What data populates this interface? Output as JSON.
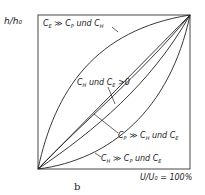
{
  "figure": {
    "panel_label": "b",
    "y_axis_label": "h/h₀",
    "x_axis_label": "U/U₀ = 100%",
    "colors": {
      "line": "#222222",
      "background": "#ffffff"
    }
  },
  "curves": [
    {
      "id": "upper",
      "label": "C'E >> C'P und C'H",
      "shape": "concave-up-left"
    },
    {
      "id": "middle",
      "label": "C'H und C'E > 0",
      "shape": "near-linear"
    },
    {
      "id": "near-diagonal",
      "label": "C'P >> C'H und C'E",
      "shape": "near-linear"
    },
    {
      "id": "lower",
      "label": "C'H >> C'P und C'E",
      "shape": "convex-down-right"
    }
  ],
  "labels": {
    "upper": {
      "c1": "C",
      "s1": "E",
      "mid": " ≫ ",
      "c2": "C",
      "s2": "P",
      "und": " und ",
      "c3": "C",
      "s3": "H"
    },
    "middle": {
      "c1": "C",
      "s1": "H",
      "und": " und ",
      "c2": "C",
      "s2": "E",
      "tail": " >0"
    },
    "near": {
      "c1": "C",
      "s1": "P",
      "mid": " ≫ ",
      "c2": "C",
      "s2": "H",
      "und": " und ",
      "c3": "C",
      "s3": "E"
    },
    "lower": {
      "c1": "C",
      "s1": "H",
      "mid": " ≫ ",
      "c2": "C",
      "s2": "P",
      "und": " und ",
      "c3": "C",
      "s3": "E"
    }
  }
}
